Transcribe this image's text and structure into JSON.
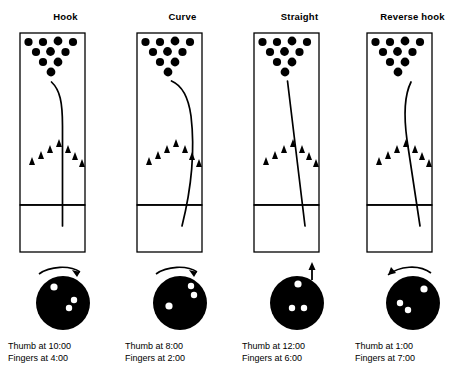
{
  "figure": {
    "colors": {
      "ink": "#000000",
      "paper": "#ffffff"
    },
    "lane": {
      "pin_rows": [
        4,
        3,
        2,
        1
      ],
      "pin_count": 10,
      "arrow_count": 7,
      "arrow_label": "lane-targeting-arrows",
      "foul_line_label": "foul-line"
    }
  },
  "panels": [
    {
      "id": "hook",
      "title": "Hook",
      "x": 8,
      "caption": {
        "thumb": "Thumb at 10:00",
        "fingers": "Fingers at 4:00"
      },
      "ball": {
        "thumb_clock": "10:00",
        "fingers_clock": "4:00",
        "rotation_arrow": "clockwise-curved-arrow",
        "thumb_hole": {
          "cx": 46,
          "cy": 29,
          "r": 3.6
        },
        "finger_holes": [
          {
            "cx": 66,
            "cy": 42,
            "r": 3.2
          },
          {
            "cx": 61,
            "cy": 50,
            "r": 3.2
          }
        ]
      },
      "path": {
        "type": "hook",
        "description": "straight down lane then sharp hook left into pocket",
        "d": "M 54.5 196 L 54.5 96 C 54.5 72 52 60 43.5 52"
      }
    },
    {
      "id": "curve",
      "title": "Curve",
      "x": 125,
      "caption": {
        "thumb": "Thumb at 8:00",
        "fingers": "Fingers at 2:00"
      },
      "ball": {
        "thumb_clock": "8:00",
        "fingers_clock": "2:00",
        "rotation_arrow": "clockwise-curved-arrow",
        "thumb_hole": {
          "cx": 44,
          "cy": 48,
          "r": 3.6
        },
        "finger_holes": [
          {
            "cx": 66,
            "cy": 28,
            "r": 3.2
          },
          {
            "cx": 69,
            "cy": 37,
            "r": 3.2
          }
        ]
      },
      "path": {
        "type": "curve",
        "description": "continuous arc bowing right then sweeping left to pocket",
        "d": "M 57 196 C 66 160 70 120 66 86 C 63 64 56 55 46.5 51"
      }
    },
    {
      "id": "straight",
      "title": "Straight",
      "x": 242,
      "caption": {
        "thumb": "Thumb at 12:00",
        "fingers": "Fingers at 6:00"
      },
      "ball": {
        "thumb_clock": "12:00",
        "fingers_clock": "6:00",
        "rotation_arrow": "straight-up-arrow",
        "thumb_hole": {
          "cx": 56,
          "cy": 26,
          "r": 3.6
        },
        "finger_holes": [
          {
            "cx": 50,
            "cy": 50,
            "r": 3.2
          },
          {
            "cx": 62,
            "cy": 50,
            "r": 3.2
          }
        ]
      },
      "path": {
        "type": "straight",
        "description": "straight diagonal line from right of foul line to pocket",
        "d": "M 63 196 L 45.5 51"
      }
    },
    {
      "id": "reverse-hook",
      "title": "Reverse hook",
      "x": 355,
      "caption": {
        "thumb": "Thumb at 1:00",
        "fingers": "Fingers at 7:00"
      },
      "ball": {
        "thumb_clock": "1:00",
        "fingers_clock": "7:00",
        "rotation_arrow": "counter-clockwise-curved-arrow",
        "thumb_hole": {
          "cx": 69,
          "cy": 31,
          "r": 3.6
        },
        "finger_holes": [
          {
            "cx": 45,
            "cy": 45,
            "r": 3.2
          },
          {
            "cx": 53,
            "cy": 52,
            "r": 3.2
          }
        ]
      },
      "path": {
        "type": "reverse-hook",
        "description": "diagonal up-left then bending back right at the pins",
        "d": "M 65 196 L 52 110 C 49 88 49 66 56 52"
      }
    }
  ]
}
